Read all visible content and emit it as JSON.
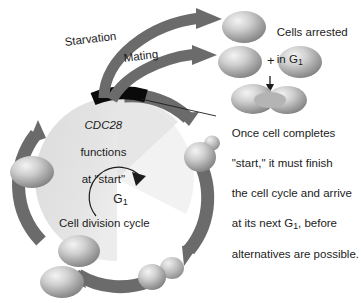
{
  "figure": {
    "background_color": "#ffffff",
    "width": 361,
    "height": 303
  },
  "colors": {
    "arrow_gray": "#6b6b6b",
    "arrow_gray_dark": "#5a5a5a",
    "wedge_fill": "#e2e2e2",
    "start_marker": "#0a0a0a",
    "cell_body": "#9a9a9a",
    "cell_highlight": "#ededed",
    "text": "#1c1c1c",
    "leader_line": "#1c1c1c"
  },
  "labels": {
    "starvation": "Starvation",
    "mating": "Mating",
    "cdc28_gene": "CDC28",
    "cdc28_line2": "functions",
    "cdc28_line3": "at \"start\"",
    "g1_phase": "G",
    "g1_phase_sub": "1",
    "cell_division_cycle": "Cell division cycle",
    "plus_sign": "+"
  },
  "annotations": {
    "arrested": {
      "line1": "Cells arrested",
      "line2_pre": "in G",
      "line2_sub": "1"
    },
    "note": {
      "line1": "Once cell completes",
      "line2": "\"start,\" it must finish",
      "line3": "the cell cycle and arrive",
      "line4_pre": "at its next G",
      "line4_sub": "1",
      "line4_post": ", before",
      "line5": "alternatives are possible."
    }
  },
  "cells": [
    {
      "name": "g1-cell-left",
      "stage": "G1 unbudded cell"
    },
    {
      "name": "daughter-cell-lower-left",
      "stage": "separated daughter cell"
    },
    {
      "name": "daughter-cell-bottom",
      "stage": "separated daughter cell"
    },
    {
      "name": "large-budded-cell-bottom-right",
      "stage": "large budded cell"
    },
    {
      "name": "small-budded-cell-right",
      "stage": "small budded cell emerging after start"
    },
    {
      "name": "arrested-cell",
      "stage": "cell arrested in G1 by starvation"
    },
    {
      "name": "mating-cell-a",
      "stage": "haploid mating partner"
    },
    {
      "name": "mating-cell-alpha",
      "stage": "haploid mating partner"
    },
    {
      "name": "zygote",
      "stage": "fused zygote"
    }
  ],
  "arrows": [
    {
      "name": "cycle-arrow-top-right",
      "description": "cycle arc from start marker to small budded cell"
    },
    {
      "name": "cycle-arrow-right",
      "description": "cycle arc down to large budded cell"
    },
    {
      "name": "cycle-arrow-bottom",
      "description": "cycle arc to daughter cells"
    },
    {
      "name": "cycle-arrow-left",
      "description": "cycle arc up to G1 cell"
    },
    {
      "name": "starvation-arrow",
      "description": "branch arrow from start to arrested cell"
    },
    {
      "name": "mating-arrow",
      "description": "branch arrow from start to mating cells"
    },
    {
      "name": "fusion-arrow",
      "description": "short downward arrow to zygote"
    },
    {
      "name": "g1-arc-arrow",
      "description": "small arc arrow indicating G1 direction"
    }
  ]
}
